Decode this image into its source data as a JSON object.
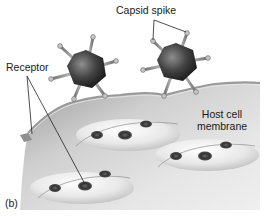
{
  "figure": {
    "panel_label": "(b)",
    "labels": {
      "capsid_spike": "Capsid spike",
      "receptor": "Receptor",
      "host_cell_membrane_line1": "Host cell",
      "host_cell_membrane_line2": "membrane"
    },
    "elements": {
      "viruses": [
        {
          "name": "virus-left",
          "cx": 86,
          "cy": 70
        },
        {
          "name": "virus-right",
          "cx": 176,
          "cy": 63
        }
      ],
      "receptor_bumps": 3,
      "receptors_per_bump": 3
    },
    "colors": {
      "membrane_surface": "#c9c9c9",
      "membrane_light": "#f2f2f2",
      "virus_core": "#2a2a2a",
      "spike": "#8a8a8a",
      "receptor": "#3c3c3c",
      "text": "#1a1a1a"
    }
  }
}
